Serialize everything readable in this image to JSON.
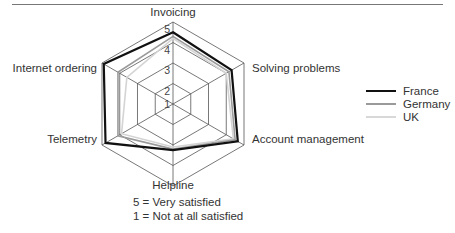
{
  "chart_data": {
    "type": "radar",
    "title": "",
    "categories": [
      "Invoicing",
      "Solving problems",
      "Account management",
      "Helpline",
      "Telemetry",
      "Internet ordering"
    ],
    "scale": {
      "min": 1,
      "max": 5,
      "ticks": [
        1,
        2,
        3,
        4,
        5
      ]
    },
    "series": [
      {
        "name": "France",
        "color": "#111111",
        "width": 2.2,
        "values": [
          4.5,
          4.3,
          4.65,
          3.25,
          4.8,
          4.9
        ]
      },
      {
        "name": "Germany",
        "color": "#9a9a9a",
        "width": 1.6,
        "values": [
          4.3,
          4.15,
          4.5,
          3.2,
          4.1,
          4.1
        ]
      },
      {
        "name": "UK",
        "color": "#d4d4d4",
        "width": 1.6,
        "values": [
          4.2,
          4.0,
          4.4,
          3.1,
          3.9,
          3.6
        ]
      }
    ],
    "legend_position": "right",
    "notes": [
      "5 = Very satisfied",
      "1 = Not at all satisfied"
    ]
  },
  "legend": [
    {
      "label": "France"
    },
    {
      "label": "Germany"
    },
    {
      "label": "UK"
    }
  ],
  "notes": {
    "very": "5 = Very satisfied",
    "not": "1 = Not at all satisfied"
  }
}
